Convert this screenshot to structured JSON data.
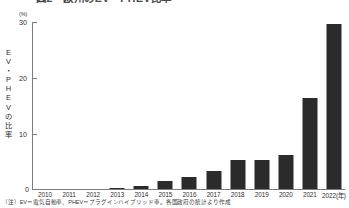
{
  "figure": {
    "title": "図2　欧州のEV・PHEV比率",
    "y_axis_unit": "(%)",
    "y_axis_title_chars": [
      "E",
      "V",
      "・",
      "P",
      "H",
      "E",
      "V",
      "の",
      "比",
      "率"
    ],
    "y_axis_title": "EV・PHEVの比率",
    "zero_label": "0",
    "footnote": "（注）EV＝電気自動車、PHEV＝プラグインハイブリッド車。各国政府の統計より作成",
    "bar_color": "#2b2b2b",
    "axis_color": "#7d7d7d",
    "text_color": "#2f2f2f"
  },
  "chart_data": {
    "type": "bar",
    "title": "図2　欧州のEV・PHEV比率",
    "xlabel": "2022(年)",
    "ylabel": "EV・PHEVの比率",
    "yunit": "(%)",
    "ylim": [
      0,
      30
    ],
    "yticks": [
      0,
      10,
      20,
      30
    ],
    "ytick_labels": [
      "0",
      "10",
      "20",
      "30"
    ],
    "grid": false,
    "legend": "none",
    "categories": [
      "2010",
      "2011",
      "2012",
      "2013",
      "2014",
      "2015",
      "2016",
      "2017",
      "2018",
      "2019",
      "2020",
      "2021",
      "2022(年)"
    ],
    "values": [
      0.0,
      0.0,
      0.0,
      0.1,
      0.6,
      1.5,
      2.2,
      3.3,
      5.1,
      5.2,
      6.0,
      16.2,
      29.5
    ],
    "series": [
      {
        "name": "EV・PHEVの比率",
        "values": [
          0.0,
          0.0,
          0.0,
          0.1,
          0.6,
          1.5,
          2.2,
          3.3,
          5.1,
          5.2,
          6.0,
          16.2,
          29.5
        ]
      }
    ]
  }
}
